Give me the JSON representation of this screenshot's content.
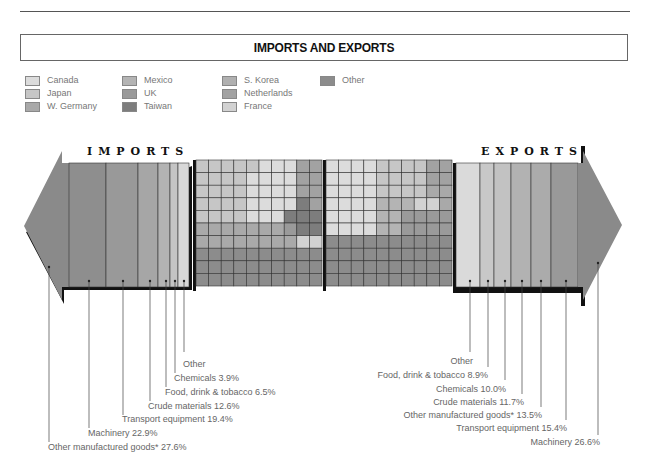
{
  "title": "IMPORTS AND EXPORTS",
  "legend": [
    {
      "label": "Canada",
      "color": "#dcdcdc"
    },
    {
      "label": "Japan",
      "color": "#c6c6c6"
    },
    {
      "label": "W. Germany",
      "color": "#a9a9a9"
    },
    {
      "label": "Mexico",
      "color": "#b4b4b4"
    },
    {
      "label": "UK",
      "color": "#9a9a9a"
    },
    {
      "label": "Taiwan",
      "color": "#7d7d7d"
    },
    {
      "label": "S. Korea",
      "color": "#b0b0b0"
    },
    {
      "label": "Netherlands",
      "color": "#a2a2a2"
    },
    {
      "label": "France",
      "color": "#d2d2d2"
    },
    {
      "label": "Other",
      "color": "#8c8c8c"
    }
  ],
  "imports": {
    "heading": "IMPORTS",
    "labels": [
      "Other",
      "Chemicals 3.9%",
      "Food, drink & tobacco 6.5%",
      "Crude materials 12.6%",
      "Transport equipment 19.4%",
      "Machinery 22.9%",
      "Other manufactured goods* 27.6%"
    ]
  },
  "exports": {
    "heading": "EXPORTS",
    "labels": [
      "Other",
      "Food, drink & tobacco 8.9%",
      "Chemicals 10.0%",
      "Crude materials 11.7%",
      "Other manufactured goods* 13.5%",
      "Transport equipment 15.4%",
      "Machinery 26.6%"
    ]
  },
  "chart_data": [
    {
      "type": "bar",
      "title": "IMPORTS",
      "orientation": "stacked-horizontal-arrow",
      "categories": [
        "Other manufactured goods*",
        "Machinery",
        "Transport equipment",
        "Crude materials",
        "Food, drink & tobacco",
        "Chemicals",
        "Other"
      ],
      "values": [
        27.6,
        22.9,
        19.4,
        12.6,
        6.5,
        3.9,
        7.1
      ],
      "unit": "%",
      "note": "'Other' share not labeled; estimated as remainder"
    },
    {
      "type": "bar",
      "title": "EXPORTS",
      "orientation": "stacked-horizontal-arrow",
      "categories": [
        "Other",
        "Food, drink & tobacco",
        "Chemicals",
        "Crude materials",
        "Other manufactured goods*",
        "Transport equipment",
        "Machinery"
      ],
      "values": [
        13.9,
        8.9,
        10.0,
        11.7,
        13.5,
        15.4,
        26.6
      ],
      "unit": "%",
      "note": "'Other' share not labeled; estimated as remainder"
    },
    {
      "type": "heatmap",
      "title": "Imports by country (10x10 grid, 1 square = 1%)",
      "legend": [
        "Canada",
        "Japan",
        "W. Germany",
        "Mexico",
        "UK",
        "Taiwan",
        "S. Korea",
        "Netherlands",
        "France",
        "Other"
      ],
      "grid": [
        [
          1,
          1,
          1,
          1,
          1,
          0,
          0,
          0,
          7,
          7
        ],
        [
          1,
          1,
          1,
          1,
          0,
          0,
          0,
          0,
          7,
          7
        ],
        [
          1,
          1,
          1,
          1,
          0,
          0,
          0,
          0,
          7,
          7
        ],
        [
          1,
          1,
          1,
          1,
          0,
          0,
          0,
          0,
          5,
          7
        ],
        [
          1,
          1,
          1,
          1,
          0,
          0,
          0,
          5,
          5,
          5
        ],
        [
          2,
          2,
          2,
          2,
          2,
          2,
          2,
          4,
          5,
          5
        ],
        [
          2,
          2,
          2,
          2,
          2,
          2,
          2,
          2,
          8,
          8
        ],
        [
          9,
          9,
          9,
          9,
          9,
          9,
          9,
          9,
          9,
          9
        ],
        [
          9,
          9,
          9,
          9,
          9,
          9,
          9,
          9,
          9,
          9
        ],
        [
          9,
          9,
          9,
          9,
          9,
          9,
          9,
          9,
          9,
          9
        ]
      ]
    },
    {
      "type": "heatmap",
      "title": "Exports by country (10x10 grid, 1 square = 1%)",
      "legend": [
        "Canada",
        "Japan",
        "W. Germany",
        "Mexico",
        "UK",
        "Taiwan",
        "S. Korea",
        "Netherlands",
        "France",
        "Other"
      ],
      "grid": [
        [
          0,
          0,
          0,
          0,
          1,
          1,
          1,
          1,
          7,
          7
        ],
        [
          0,
          0,
          0,
          0,
          1,
          1,
          1,
          1,
          7,
          7
        ],
        [
          0,
          0,
          0,
          0,
          1,
          1,
          1,
          1,
          2,
          2
        ],
        [
          0,
          0,
          0,
          0,
          3,
          3,
          3,
          8,
          8,
          2
        ],
        [
          0,
          0,
          0,
          0,
          3,
          3,
          4,
          4,
          4,
          4
        ],
        [
          0,
          0,
          0,
          0,
          3,
          3,
          4,
          4,
          4,
          4
        ],
        [
          9,
          9,
          9,
          9,
          9,
          9,
          9,
          9,
          9,
          9
        ],
        [
          9,
          9,
          9,
          9,
          9,
          9,
          9,
          9,
          9,
          9
        ],
        [
          9,
          9,
          9,
          9,
          9,
          9,
          9,
          9,
          9,
          9
        ],
        [
          9,
          9,
          9,
          9,
          9,
          9,
          9,
          9,
          9,
          9
        ]
      ]
    }
  ]
}
